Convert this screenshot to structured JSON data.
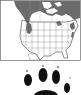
{
  "map": {
    "region": "North America",
    "range_color": "#6b6b6b",
    "land_color": "#ffffff",
    "border_color": "#444444",
    "frame_color": "#333333"
  },
  "track": {
    "icon": "paw-print-icon",
    "pad_color": "#111111",
    "toes": 4
  }
}
